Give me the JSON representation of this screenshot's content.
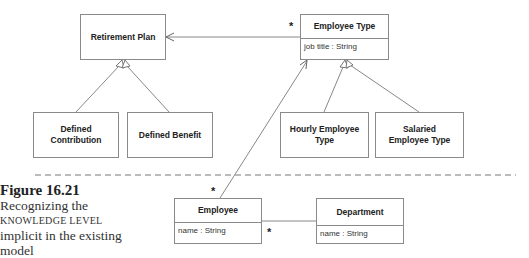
{
  "diagram": {
    "classes": {
      "retirement_plan": {
        "name": "Retirement Plan"
      },
      "employee_type": {
        "name": "Employee Type",
        "attributes": [
          "job title : String"
        ]
      },
      "defined_contribution": {
        "name": "Defined Contribution"
      },
      "defined_benefit": {
        "name": "Defined Benefit"
      },
      "hourly_employee_type": {
        "name": "Hourly Employee Type"
      },
      "salaried_employee_type": {
        "name": "Salaried Employee Type"
      },
      "employee": {
        "name": "Employee",
        "attributes": [
          "name : String"
        ]
      },
      "department": {
        "name": "Department",
        "attributes": [
          "name : String"
        ]
      }
    },
    "relationships": [
      {
        "type": "association",
        "from": "Employee Type",
        "to": "Retirement Plan",
        "navigable_to": "Retirement Plan",
        "multiplicity_from": "*"
      },
      {
        "type": "generalization",
        "child": "Defined Contribution",
        "parent": "Retirement Plan"
      },
      {
        "type": "generalization",
        "child": "Defined Benefit",
        "parent": "Retirement Plan"
      },
      {
        "type": "generalization",
        "child": "Hourly Employee Type",
        "parent": "Employee Type"
      },
      {
        "type": "generalization",
        "child": "Salaried Employee Type",
        "parent": "Employee Type"
      },
      {
        "type": "association",
        "from": "Employee",
        "to": "Employee Type",
        "navigable_to": "Employee Type",
        "multiplicity_from": "*"
      },
      {
        "type": "association",
        "from": "Employee",
        "to": "Department",
        "multiplicity_near_employee": "*"
      }
    ],
    "multiplicities": {
      "employee_type_side": "*",
      "employee_top": "*",
      "employee_department": "*"
    }
  },
  "caption": {
    "figure": "Figure 16.21",
    "line1": "Recognizing the",
    "line2": "KNOWLEDGE LEVEL",
    "line3": "implicit in the existing",
    "line4": "model"
  }
}
